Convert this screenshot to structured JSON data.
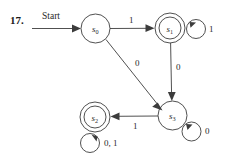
{
  "exercise": {
    "number": "17."
  },
  "diagram": {
    "start_label": "Start",
    "states": [
      {
        "id": "s0",
        "name": "s",
        "sub": "0",
        "accepting": false,
        "cx": 95.5,
        "cy": 28.5,
        "r": 14.5
      },
      {
        "id": "s1",
        "name": "s",
        "sub": "1",
        "accepting": true,
        "cx": 170.0,
        "cy": 28.0,
        "r": 15.0
      },
      {
        "id": "s2",
        "name": "s",
        "sub": "2",
        "accepting": true,
        "cx": 95.0,
        "cy": 117.0,
        "r": 15.0
      },
      {
        "id": "s3",
        "name": "s",
        "sub": "3",
        "accepting": false,
        "cx": 172.5,
        "cy": 115.5,
        "r": 14.5
      }
    ],
    "transitions": [
      {
        "from": "s0",
        "to": "s1",
        "label": "1",
        "kind": "straight"
      },
      {
        "from": "s0",
        "to": "s3",
        "label": "0",
        "kind": "straight"
      },
      {
        "from": "s1",
        "to": "s3",
        "label": "0",
        "kind": "straight"
      },
      {
        "from": "s3",
        "to": "s2",
        "label": "1",
        "kind": "straight"
      },
      {
        "from": "s1",
        "to": "s1",
        "label": "1",
        "kind": "self"
      },
      {
        "from": "s2",
        "to": "s2",
        "label": "0, 1",
        "kind": "self"
      },
      {
        "from": "s3",
        "to": "s3",
        "label": "0",
        "kind": "self"
      }
    ],
    "edge_label_s0_s1": "1",
    "edge_label_s0_s3": "0",
    "edge_label_s1_s3": "0",
    "edge_label_s3_s2": "1",
    "loop_label_s1": "1",
    "loop_label_s2": "0, 1",
    "loop_label_s3": "0",
    "colors": {
      "ink": "#3c3c3c",
      "text": "#2a2a2a",
      "background": "#ffffff"
    }
  }
}
